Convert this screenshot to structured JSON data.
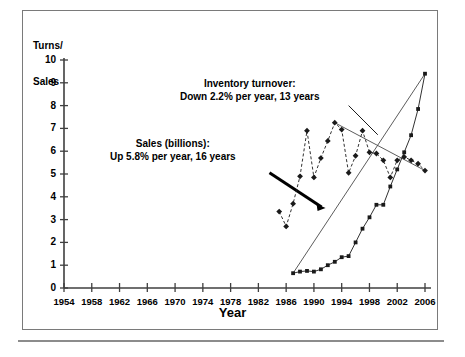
{
  "figure": {
    "y_axis_title": "Turns/\nSales",
    "y_axis_title_line1": "Turns/",
    "y_axis_title_line2": "Sales",
    "x_axis_title": "Year"
  },
  "annotations": {
    "turnover": {
      "line1": "Inventory turnover:",
      "line2": "Down 2.2% per year, 13 years"
    },
    "sales": {
      "line1": "Sales (billions):",
      "line2": "Up 5.8% per year, 16 years"
    }
  },
  "chart_data": {
    "type": "line",
    "title": "",
    "subtitle": "",
    "xlabel": "Year",
    "ylabel": "Turns/Sales",
    "xlim": [
      1954,
      2006
    ],
    "ylim": [
      0,
      10
    ],
    "grid": false,
    "legend": "none",
    "x_ticks": [
      1954,
      1958,
      1962,
      1966,
      1970,
      1974,
      1978,
      1982,
      1986,
      1990,
      1994,
      1998,
      2002,
      2006
    ],
    "y_ticks": [
      0,
      1,
      2,
      3,
      4,
      5,
      6,
      7,
      8,
      9,
      10
    ],
    "series": [
      {
        "name": "Inventory turnover",
        "marker": "diamond",
        "line_style": "dashed",
        "color": "#1a1a1a",
        "x": [
          1985,
          1986,
          1987,
          1988,
          1989,
          1990,
          1991,
          1992,
          1993,
          1994,
          1995,
          1996,
          1997,
          1998,
          1999,
          2000,
          2001,
          2002,
          2003,
          2004,
          2005,
          2006
        ],
        "values": [
          3.35,
          2.7,
          3.7,
          4.9,
          6.9,
          4.85,
          5.7,
          6.45,
          7.25,
          6.95,
          5.05,
          5.8,
          6.9,
          5.95,
          5.9,
          5.6,
          4.85,
          5.6,
          5.75,
          5.6,
          5.45,
          5.15
        ]
      },
      {
        "name": "Sales (billions)",
        "marker": "square",
        "line_style": "solid",
        "color": "#1a1a1a",
        "x": [
          1987,
          1988,
          1989,
          1990,
          1991,
          1992,
          1993,
          1994,
          1995,
          1996,
          1997,
          1998,
          1999,
          2000,
          2001,
          2002,
          2003,
          2004,
          2005,
          2006
        ],
        "values": [
          0.65,
          0.72,
          0.75,
          0.72,
          0.82,
          1.0,
          1.15,
          1.35,
          1.4,
          2.0,
          2.6,
          3.1,
          3.65,
          3.65,
          4.45,
          5.2,
          5.95,
          6.7,
          7.85,
          9.4
        ]
      }
    ],
    "trend_lines": [
      {
        "name": "Inventory turnover trend",
        "style": "thin-solid",
        "annotation": "Down 2.2% per year, 13 years",
        "x": [
          1993,
          2006
        ],
        "y": [
          7.25,
          5.15
        ]
      },
      {
        "name": "Sales trend",
        "style": "thin-solid",
        "annotation": "Up 5.8% per year, 16 years",
        "x": [
          1987,
          2006
        ],
        "y": [
          0.65,
          9.4
        ]
      }
    ],
    "callouts": [
      {
        "name": "sales-callout-bar",
        "style": "thick-solid",
        "from": [
          1983.6,
          5.05
        ],
        "to": [
          1991.1,
          3.55
        ]
      },
      {
        "name": "turnover-leader-line",
        "style": "thin-solid",
        "from": [
          1995.0,
          8.0
        ],
        "to": [
          1999.2,
          6.72
        ]
      }
    ]
  }
}
